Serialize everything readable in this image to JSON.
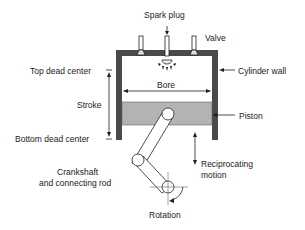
{
  "labels": {
    "spark_plug": "Spark plug",
    "valve": "Valve",
    "top_dead_center": "Top dead center",
    "cylinder_wall": "Cylinder wall",
    "bore": "Bore",
    "stroke": "Stroke",
    "piston": "Piston",
    "bottom_dead_center": "Bottom dead center",
    "crankshaft_line1": "Crankshaft",
    "crankshaft_line2": "and connecting rod",
    "reciprocating_line1": "Reciprocating",
    "reciprocating_line2": "motion",
    "rotation": "Rotation"
  },
  "colors": {
    "wall": "#4a4a4a",
    "piston": "#b3b3b3",
    "line": "#222222"
  }
}
